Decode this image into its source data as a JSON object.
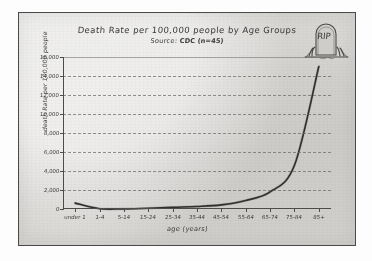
{
  "chart_data": {
    "type": "line",
    "title": "Death Rate per 100,000 people by Age Groups",
    "subtitle_prefix": "Source: ",
    "subtitle_source": "CDC",
    "subtitle_note": "(n=45)",
    "xlabel": "age (years)",
    "ylabel": "death Rate per 100,000 people",
    "categories": [
      "under 1",
      "1-4",
      "5-14",
      "15-24",
      "25-34",
      "35-44",
      "45-54",
      "55-64",
      "65-74",
      "75-84",
      "85+"
    ],
    "values": [
      620,
      30,
      15,
      75,
      180,
      260,
      430,
      900,
      1800,
      4600,
      15000
    ],
    "ylim": [
      0,
      16000
    ],
    "yticks": [
      0,
      2000,
      4000,
      6000,
      8000,
      10000,
      12000,
      14000,
      16000
    ],
    "ytick_labels": [
      "0",
      "2,000",
      "4,000",
      "6,000",
      "8,000",
      "10,000",
      "12,000",
      "14,000",
      "16,000"
    ],
    "grid": "horizontal-dashed",
    "legend": "none",
    "style": "hand-drawn",
    "line_color": "#2f2f2d"
  },
  "decoration": {
    "tombstone_text": "RIP",
    "tombstone_name": "tombstone-doodle"
  }
}
